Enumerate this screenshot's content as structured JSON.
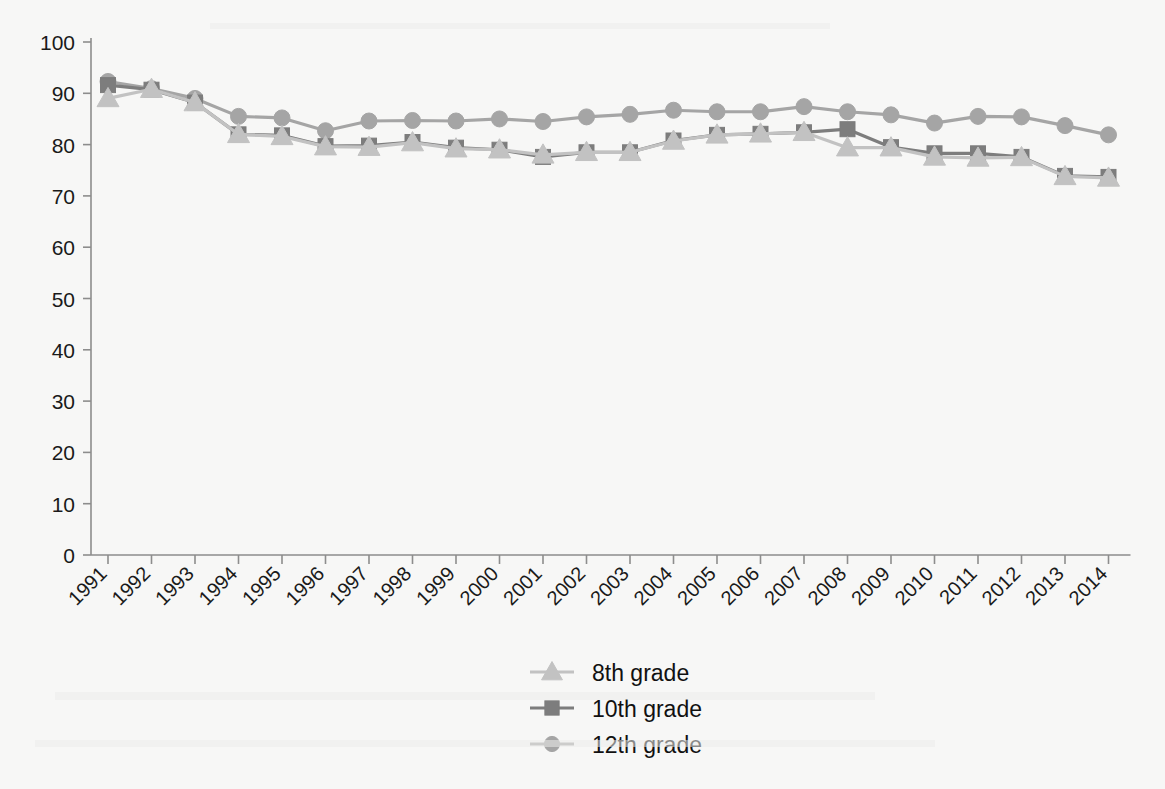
{
  "chart_data": {
    "type": "line",
    "title": "",
    "subtitle": "",
    "xlabel": "",
    "ylabel": "",
    "xlim": [
      1991,
      2014
    ],
    "ylim": [
      0,
      100
    ],
    "ytick_step": 10,
    "grid": false,
    "legend_position": "bottom-center",
    "categories": [
      "1991",
      "1992",
      "1993",
      "1994",
      "1995",
      "1996",
      "1997",
      "1998",
      "1999",
      "2000",
      "2001",
      "2002",
      "2003",
      "2004",
      "2005",
      "2006",
      "2007",
      "2008",
      "2009",
      "2010",
      "2011",
      "2012",
      "2013",
      "2014"
    ],
    "yticks": [
      "0",
      "10",
      "20",
      "30",
      "40",
      "50",
      "60",
      "70",
      "80",
      "90",
      "100"
    ],
    "series": [
      {
        "name": "8th grade",
        "marker": "triangle",
        "color": "#c2c2c2",
        "line_color": "#c2c2c2",
        "values": [
          89.0,
          90.8,
          88.2,
          82.0,
          81.6,
          79.6,
          79.5,
          80.4,
          79.2,
          79.0,
          78.0,
          78.5,
          78.5,
          80.7,
          81.9,
          82.1,
          82.4,
          79.4,
          79.4,
          77.6,
          77.4,
          77.5,
          73.8,
          73.5
        ]
      },
      {
        "name": "10th grade",
        "marker": "square",
        "color": "#7d7d7d",
        "line_color": "#7d7d7d",
        "values": [
          91.6,
          90.7,
          88.2,
          82.0,
          81.8,
          79.7,
          79.8,
          80.5,
          79.4,
          79.0,
          77.6,
          78.5,
          78.5,
          80.8,
          81.9,
          82.1,
          82.4,
          83.0,
          79.5,
          78.3,
          78.3,
          77.6,
          73.9,
          73.7
        ]
      },
      {
        "name": "12th grade",
        "marker": "circle",
        "color": "#a5a5a5",
        "line_color": "#a5a5a5",
        "values": [
          92.3,
          90.9,
          89.0,
          85.5,
          85.2,
          82.7,
          84.6,
          84.7,
          84.6,
          85.0,
          84.5,
          85.4,
          85.9,
          86.7,
          86.4,
          86.4,
          87.4,
          86.4,
          85.8,
          84.2,
          85.5,
          85.4,
          83.7,
          81.9
        ]
      }
    ]
  },
  "legend": {
    "items": [
      {
        "label": "8th grade"
      },
      {
        "label": "10th grade"
      },
      {
        "label": "12th grade"
      }
    ]
  },
  "colors": {
    "grade8": "#c2c2c2",
    "grade10": "#7d7d7d",
    "grade12": "#a5a5a5",
    "axis": "#8d8d8d",
    "text": "#1a1a1a",
    "background": "#f7f7f6"
  }
}
